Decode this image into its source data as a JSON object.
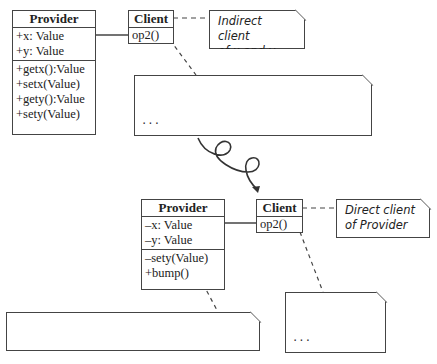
{
  "top": {
    "provider": {
      "name": "Provider",
      "attributes": [
        "+x: Value",
        "+y: Value"
      ],
      "operations": [
        "+getx():Value",
        "+setx(Value)",
        "+gety():Value",
        "+sety(Value)"
      ]
    },
    "client": {
      "name": "Client",
      "operation": "op2()"
    },
    "note_indirect": [
      "Indirect client",
      "of x and y"
    ],
    "code_note": [
      "...",
      "provider.sety(provider.x + provider.y)",
      "..."
    ]
  },
  "bottom": {
    "provider": {
      "name": "Provider",
      "attributes": [
        "–x: Value",
        "–y: Value"
      ],
      "operations": [
        "–sety(Value)",
        "+bump()"
      ]
    },
    "client": {
      "name": "Client",
      "operation": "op2()"
    },
    "note_direct": [
      "Direct client",
      "of Provider"
    ],
    "bump_note": [
      "...",
      "provider.bump()",
      "..."
    ],
    "sety_note": [
      "provider.sety(provider.x + provider.y)"
    ]
  },
  "transform_arrow": "curly-arrow"
}
